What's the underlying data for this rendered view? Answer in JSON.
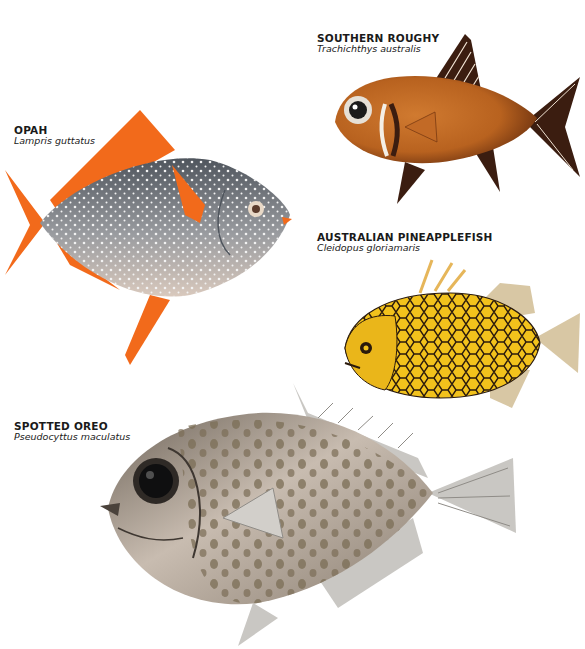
{
  "page": {
    "background": "#ffffff",
    "species": [
      {
        "id": "southern-roughy",
        "common_name": "SOUTHERN ROUGHY",
        "scientific_name": "Trachichthys australis",
        "colors": {
          "body": "#b8621f",
          "body_dark": "#7a3a12",
          "fins": "#3b1d10",
          "gill_stripe": "#f4efe6"
        }
      },
      {
        "id": "opah",
        "common_name": "OPAH",
        "scientific_name": "Lampris guttatus",
        "colors": {
          "body": "#7d838c",
          "belly": "#d9c9bd",
          "fins": "#f26a1b",
          "spots": "#f2f2f2"
        }
      },
      {
        "id": "australian-pineapplefish",
        "common_name": "AUSTRALIAN PINEAPPLEFISH",
        "scientific_name": "Cleidopus gloriamaris",
        "colors": {
          "body": "#f2c21c",
          "scale_outline": "#2a1a0c",
          "fins": "#d8c7a4"
        }
      },
      {
        "id": "spotted-oreo",
        "common_name": "SPOTTED OREO",
        "scientific_name": "Pseudocyttus maculatus",
        "colors": {
          "body": "#b9aea3",
          "body_dark": "#5b5249",
          "spots": "#7b6d55",
          "fins": "#c9c7c3"
        }
      }
    ]
  }
}
